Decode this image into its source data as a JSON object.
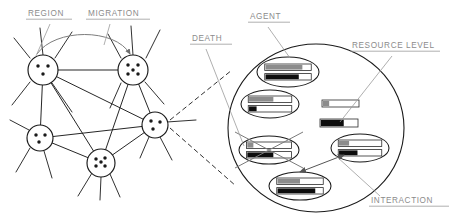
{
  "diagram": {
    "background_color": "#ffffff",
    "ink_color": "#1a1a1a",
    "label_color": "#8b8b8b",
    "leader_color": "#9a9a9a",
    "bar_gray_color": "#8c8c8c",
    "bar_black_color": "#0d0d0d",
    "bar_outline_color": "#2b2b2b"
  },
  "labels": [
    {
      "id": "region",
      "text": "REGION",
      "x": 28,
      "y": 16,
      "underline_width": 44
    },
    {
      "id": "migration",
      "text": "MIGRATION",
      "x": 88,
      "y": 16,
      "underline_width": 62
    },
    {
      "id": "death",
      "text": "DEATH",
      "x": 192,
      "y": 41,
      "underline_width": 40
    },
    {
      "id": "agent",
      "text": "AGENT",
      "x": 250,
      "y": 19,
      "underline_width": 40
    },
    {
      "id": "resource_level",
      "text": "RESOURCE LEVEL",
      "x": 352,
      "y": 48,
      "underline_width": 88
    },
    {
      "id": "interaction",
      "text": "INTERACTION",
      "x": 371,
      "y": 203,
      "underline_width": 78
    }
  ],
  "network": {
    "caption": "Region network with migration links",
    "nodes": [
      {
        "id": "region-1",
        "cx": 43,
        "cy": 70,
        "r": 15,
        "agent_count": 3,
        "dots": [
          [
            -5,
            -4
          ],
          [
            5,
            -4
          ],
          [
            0,
            4
          ]
        ]
      },
      {
        "id": "region-2",
        "cx": 133,
        "cy": 70,
        "r": 15,
        "agent_count": 5,
        "dots": [
          [
            -5,
            -5
          ],
          [
            5,
            -5
          ],
          [
            -5,
            4
          ],
          [
            5,
            4
          ],
          [
            0,
            0
          ]
        ]
      },
      {
        "id": "region-3",
        "cx": 40,
        "cy": 138,
        "r": 13,
        "agent_count": 3,
        "dots": [
          [
            -4,
            -3
          ],
          [
            5,
            -3
          ],
          [
            -1,
            4
          ]
        ]
      },
      {
        "id": "region-4",
        "cx": 101,
        "cy": 163,
        "r": 14,
        "agent_count": 5,
        "dots": [
          [
            -5,
            -4
          ],
          [
            4,
            -5
          ],
          [
            -5,
            3
          ],
          [
            4,
            3
          ],
          [
            0,
            -1
          ]
        ]
      },
      {
        "id": "region-5",
        "cx": 155,
        "cy": 125,
        "r": 13,
        "agent_count": 3,
        "dots": [
          [
            -4,
            -4
          ],
          [
            5,
            -3
          ],
          [
            -2,
            4
          ]
        ]
      }
    ],
    "edges": [
      {
        "from": "region-1",
        "to": "region-2"
      },
      {
        "from": "region-1",
        "to": "region-3"
      },
      {
        "from": "region-1",
        "to": "region-4"
      },
      {
        "from": "region-1",
        "to": "region-5"
      },
      {
        "from": "region-2",
        "to": "region-4"
      },
      {
        "from": "region-2",
        "to": "region-5"
      },
      {
        "from": "region-3",
        "to": "region-4"
      },
      {
        "from": "region-3",
        "to": "region-5"
      },
      {
        "from": "region-4",
        "to": "region-5"
      }
    ],
    "migration_arc": {
      "label": "migration",
      "from_node": "region-1",
      "to_node": "region-2",
      "path": "M 37 54 C 55 28, 115 28, 130 54"
    },
    "stub_edges": [
      [
        30,
        58,
        14,
        38
      ],
      [
        43,
        55,
        40,
        28
      ],
      [
        55,
        58,
        72,
        32
      ],
      [
        30,
        82,
        12,
        105
      ],
      [
        52,
        83,
        72,
        112
      ],
      [
        121,
        58,
        108,
        34
      ],
      [
        133,
        55,
        131,
        26
      ],
      [
        146,
        58,
        160,
        30
      ],
      [
        145,
        82,
        164,
        104
      ],
      [
        121,
        83,
        110,
        108
      ],
      [
        29,
        130,
        10,
        120
      ],
      [
        30,
        148,
        16,
        172
      ],
      [
        44,
        151,
        52,
        178
      ],
      [
        92,
        173,
        78,
        196
      ],
      [
        110,
        174,
        120,
        197
      ],
      [
        101,
        177,
        100,
        200
      ],
      [
        167,
        122,
        196,
        120
      ],
      [
        149,
        137,
        140,
        158
      ],
      [
        160,
        137,
        172,
        160
      ]
    ]
  },
  "magnifier": {
    "caption": "Magnified view of a single region",
    "cx": 316,
    "cy": 128,
    "rx": 88,
    "ry": 84,
    "connector_lines": [
      [
        170,
        120,
        232,
        70
      ],
      [
        170,
        128,
        236,
        186
      ]
    ]
  },
  "agents": [
    {
      "id": "agent-top",
      "cx": 288,
      "cy": 72,
      "rx": 31,
      "ry": 15,
      "dead": false,
      "bars": [
        {
          "id": "bar-gray",
          "type": "gray",
          "fill_pct": 82
        },
        {
          "id": "bar-black",
          "type": "black",
          "fill_pct": 74
        }
      ]
    },
    {
      "id": "agent-left-upper",
      "cx": 270,
      "cy": 104,
      "rx": 29,
      "ry": 14,
      "dead": false,
      "bars": [
        {
          "id": "bar-gray",
          "type": "gray",
          "fill_pct": 58
        },
        {
          "id": "bar-black",
          "type": "black",
          "fill_pct": 18
        }
      ]
    },
    {
      "id": "agent-dying",
      "cx": 269,
      "cy": 150,
      "rx": 30,
      "ry": 14,
      "dead": true,
      "bars": [
        {
          "id": "bar-gray",
          "type": "gray",
          "fill_pct": 14
        },
        {
          "id": "bar-black",
          "type": "black",
          "fill_pct": 60
        }
      ]
    },
    {
      "id": "agent-right",
      "cx": 360,
      "cy": 148,
      "rx": 29,
      "ry": 14,
      "dead": false,
      "bars": [
        {
          "id": "bar-gray",
          "type": "gray",
          "fill_pct": 24
        },
        {
          "id": "bar-black",
          "type": "black",
          "fill_pct": 44
        }
      ]
    },
    {
      "id": "agent-bottom",
      "cx": 300,
      "cy": 186,
      "rx": 31,
      "ry": 14,
      "dead": false,
      "bars": [
        {
          "id": "bar-gray",
          "type": "gray",
          "fill_pct": 50
        },
        {
          "id": "bar-black",
          "type": "black",
          "fill_pct": 84
        }
      ]
    }
  ],
  "sample_bars": [
    {
      "id": "sample-bar-gray",
      "type": "gray",
      "x": 322,
      "y": 100,
      "w": 37,
      "h": 7,
      "fill_pct": 18
    },
    {
      "id": "sample-bar-black",
      "type": "black",
      "x": 320,
      "y": 119,
      "w": 38,
      "h": 8,
      "fill_pct": 63
    }
  ],
  "interaction_arrow": {
    "label": "interaction",
    "from_agent": "agent-bottom",
    "to_agent": "agent-right",
    "path": "M 300 172 L 344 155"
  },
  "leaders": [
    {
      "id": "leader-region",
      "path": "M 50 24 L 36 56"
    },
    {
      "id": "leader-migration",
      "path": "M 110 24 L 104 45"
    },
    {
      "id": "leader-death",
      "path": "M 206 49 L 244 146"
    },
    {
      "id": "leader-agent",
      "path": "M 268 27 L 290 58"
    },
    {
      "id": "leader-resource",
      "path": "M 392 56 L 340 122"
    },
    {
      "id": "leader-interaction",
      "path": "M 380 196 L 336 156"
    }
  ]
}
